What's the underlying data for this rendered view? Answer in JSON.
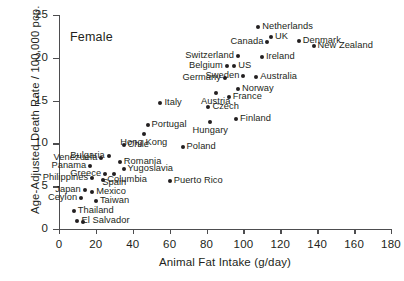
{
  "chart_data": {
    "type": "scatter",
    "title": "",
    "annotation": "Female",
    "xlabel": "Animal Fat Intake (g/day)",
    "ylabel": "Age-Adjusted Death Rate / 100,000 pcp.",
    "xlim": [
      0,
      180
    ],
    "ylim": [
      0,
      25
    ],
    "xticks": [
      0,
      20,
      40,
      60,
      80,
      100,
      120,
      140,
      160,
      180
    ],
    "yticks": [
      0,
      5,
      10,
      15,
      20,
      25
    ],
    "grid": false,
    "legend": "none",
    "point_color": "#231f20",
    "axis_color": "#4d4d4f",
    "points": [
      {
        "label": "Netherlands",
        "x": 108,
        "y": 23.6,
        "pos": "right"
      },
      {
        "label": "Denmark",
        "x": 130,
        "y": 22.0,
        "pos": "right"
      },
      {
        "label": "UK",
        "x": 115,
        "y": 22.4,
        "pos": "right"
      },
      {
        "label": "Canada",
        "x": 113,
        "y": 21.9,
        "pos": "left"
      },
      {
        "label": "New Zealand",
        "x": 138,
        "y": 21.4,
        "pos": "right"
      },
      {
        "label": "Switzerland",
        "x": 97,
        "y": 20.2,
        "pos": "left"
      },
      {
        "label": "Ireland",
        "x": 110,
        "y": 20.1,
        "pos": "right"
      },
      {
        "label": "Belgium",
        "x": 91,
        "y": 19.0,
        "pos": "left"
      },
      {
        "label": "US",
        "x": 95,
        "y": 19.0,
        "pos": "right"
      },
      {
        "label": "Sweden",
        "x": 100,
        "y": 17.9,
        "pos": "left"
      },
      {
        "label": "Australia",
        "x": 107,
        "y": 17.8,
        "pos": "right"
      },
      {
        "label": "Germany",
        "x": 90,
        "y": 17.6,
        "pos": "left"
      },
      {
        "label": "Norway",
        "x": 97,
        "y": 16.3,
        "pos": "right"
      },
      {
        "label": "Austria",
        "x": 85,
        "y": 15.9,
        "pos": "below"
      },
      {
        "label": "France",
        "x": 92,
        "y": 15.4,
        "pos": "right"
      },
      {
        "label": "Italy",
        "x": 55,
        "y": 14.7,
        "pos": "right"
      },
      {
        "label": "Czech",
        "x": 81,
        "y": 14.2,
        "pos": "right"
      },
      {
        "label": "Finland",
        "x": 96,
        "y": 12.8,
        "pos": "right"
      },
      {
        "label": "Portugal",
        "x": 48,
        "y": 12.2,
        "pos": "right"
      },
      {
        "label": "Hungary",
        "x": 82,
        "y": 12.5,
        "pos": "below"
      },
      {
        "label": "Hong Kong",
        "x": 46,
        "y": 11.1,
        "pos": "below"
      },
      {
        "label": "Poland",
        "x": 67,
        "y": 9.6,
        "pos": "right"
      },
      {
        "label": "Chile",
        "x": 35,
        "y": 9.8,
        "pos": "right"
      },
      {
        "label": "Bulgaria",
        "x": 27,
        "y": 8.5,
        "pos": "left"
      },
      {
        "label": "Venezuela",
        "x": 23,
        "y": 8.3,
        "pos": "left"
      },
      {
        "label": "Romania",
        "x": 33,
        "y": 7.8,
        "pos": "right"
      },
      {
        "label": "Panama",
        "x": 17,
        "y": 7.4,
        "pos": "left"
      },
      {
        "label": "Yugoslavia",
        "x": 35,
        "y": 7.0,
        "pos": "right"
      },
      {
        "label": "Greece",
        "x": 25,
        "y": 6.4,
        "pos": "left"
      },
      {
        "label": "Spain",
        "x": 30,
        "y": 6.4,
        "pos": "below"
      },
      {
        "label": "Philippines",
        "x": 18,
        "y": 5.9,
        "pos": "left"
      },
      {
        "label": "Columbia",
        "x": 24,
        "y": 5.7,
        "pos": "right"
      },
      {
        "label": "Puerto Rico",
        "x": 60,
        "y": 5.6,
        "pos": "right"
      },
      {
        "label": "Japan",
        "x": 14,
        "y": 4.6,
        "pos": "left"
      },
      {
        "label": "Mexico",
        "x": 18,
        "y": 4.3,
        "pos": "right"
      },
      {
        "label": "Ceylon",
        "x": 12,
        "y": 3.6,
        "pos": "left"
      },
      {
        "label": "Taiwan",
        "x": 20,
        "y": 3.3,
        "pos": "right"
      },
      {
        "label": "Thailand",
        "x": 8,
        "y": 2.1,
        "pos": "right"
      },
      {
        "label": "El Salvador",
        "x": 10,
        "y": 0.9,
        "pos": "right"
      },
      {
        "label": "",
        "x": 13,
        "y": 0.8,
        "pos": "right"
      }
    ]
  }
}
